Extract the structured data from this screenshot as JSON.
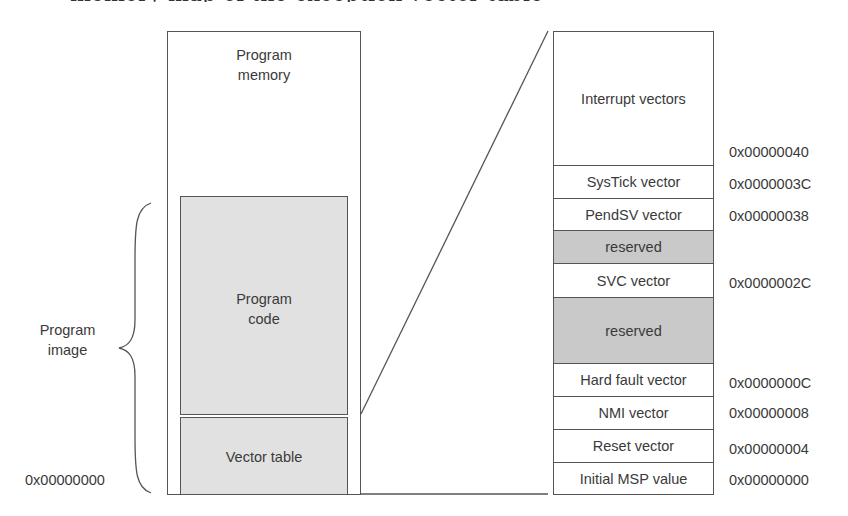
{
  "clipped_heading": "memory map of the exception vector table",
  "left": {
    "outer_label": [
      "Program",
      "memory"
    ],
    "program_code_label": [
      "Program",
      "code"
    ],
    "vector_table_label": "Vector table",
    "brace_label": [
      "Program",
      "image"
    ],
    "base_address": "0x00000000"
  },
  "vector_table": {
    "rows": [
      {
        "label": "Interrupt vectors",
        "reserved": false,
        "top": 0,
        "height": 133
      },
      {
        "label": "SysTick vector",
        "reserved": false,
        "top": 133,
        "height": 33
      },
      {
        "label": "PendSV vector",
        "reserved": false,
        "top": 166,
        "height": 32
      },
      {
        "label": "reserved",
        "reserved": true,
        "top": 198,
        "height": 33
      },
      {
        "label": "SVC vector",
        "reserved": false,
        "top": 231,
        "height": 34
      },
      {
        "label": "reserved",
        "reserved": true,
        "top": 265,
        "height": 66
      },
      {
        "label": "Hard fault vector",
        "reserved": false,
        "top": 331,
        "height": 33
      },
      {
        "label": "NMI vector",
        "reserved": false,
        "top": 364,
        "height": 33
      },
      {
        "label": "Reset vector",
        "reserved": false,
        "top": 397,
        "height": 33
      },
      {
        "label": "Initial MSP value",
        "reserved": false,
        "top": 430,
        "height": 33
      }
    ],
    "addresses": [
      {
        "value": "0x00000040",
        "y": 143
      },
      {
        "value": "0x0000003C",
        "y": 175
      },
      {
        "value": "0x00000038",
        "y": 207
      },
      {
        "value": "0x0000002C",
        "y": 274
      },
      {
        "value": "0x0000000C",
        "y": 374
      },
      {
        "value": "0x00000008",
        "y": 404
      },
      {
        "value": "0x00000004",
        "y": 440
      },
      {
        "value": "0x00000000",
        "y": 471
      }
    ]
  },
  "colors": {
    "line": "#555555",
    "program_fill": "#e1e1e1",
    "reserved_fill": "#c9c9c9",
    "text": "#3a3a3a"
  }
}
